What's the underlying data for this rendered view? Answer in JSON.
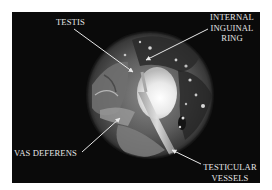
{
  "figure": {
    "labels": {
      "testis": "TESTIS",
      "internal_inguinal_ring": [
        "INTERNAL",
        "INGUINAL",
        "RING"
      ],
      "vas_deferens": "VAS DEFERENS",
      "testicular_vessels": [
        "TESTICULAR",
        "VESSELS"
      ]
    },
    "colors": {
      "background": "#ffffff",
      "panel": "#0a0a0a",
      "label_text": "#e6e6e6",
      "arrow": "#e8e8e8"
    }
  }
}
